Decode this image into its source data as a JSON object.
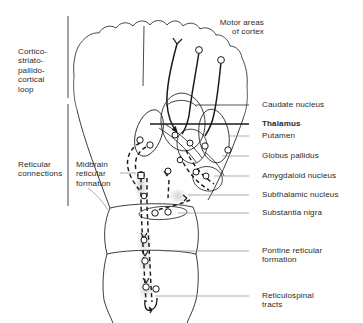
{
  "figure": {
    "title_label": "Motor areas\nof cortex",
    "accent_color": "#1a1a1a",
    "background_color": "#ffffff",
    "shadow_color": "#d9d9d9"
  },
  "group_labels": [
    {
      "id": "cortico-loop",
      "text": "Cortico-\nstriato-\npallido-\ncortical\nloop",
      "x": 18,
      "y": 47
    },
    {
      "id": "reticular-connections",
      "text": "Reticular\nconnections",
      "x": 18,
      "y": 160
    }
  ],
  "inner_labels": [
    {
      "id": "midbrain-reticular-formation",
      "text": "Midbrain\nreticular\nformation",
      "x": 76,
      "y": 160
    }
  ],
  "right_labels": [
    {
      "id": "caudate-nucleus",
      "text": "Caudate nucleus",
      "x": 262,
      "y": 101,
      "leader_y": 105,
      "leader_x1": 249,
      "leader_x2": 196,
      "bold": false
    },
    {
      "id": "thalamus",
      "text": "Thalamus",
      "x": 262,
      "y": 120,
      "leader_y": 124,
      "leader_x1": 249,
      "leader_x2": 150,
      "bold": true
    },
    {
      "id": "putamen",
      "text": "Putamen",
      "x": 262,
      "y": 132,
      "leader_y": 136,
      "leader_x1": 249,
      "leader_x2": 228,
      "bold": false
    },
    {
      "id": "globus-pallidus",
      "text": "Globus pallidus",
      "x": 262,
      "y": 152,
      "leader_y": 156,
      "leader_x1": 249,
      "leader_x2": 222,
      "bold": false
    },
    {
      "id": "amygdaloid-nucleus",
      "text": "Amygdaloid nucleus",
      "x": 262,
      "y": 172,
      "leader_y": 176,
      "leader_x1": 249,
      "leader_x2": 214,
      "bold": false
    },
    {
      "id": "subthalamic-nucleus",
      "text": "Subthalamic nucleus",
      "x": 262,
      "y": 191,
      "leader_y": 195,
      "leader_x1": 249,
      "leader_x2": 188,
      "bold": false
    },
    {
      "id": "substantia-nigra",
      "text": "Substantia nigra",
      "x": 262,
      "y": 209,
      "leader_y": 213,
      "leader_x1": 249,
      "leader_x2": 178,
      "bold": false
    },
    {
      "id": "pontine-reticular-formation",
      "text": "Pontine reticular\nformation",
      "x": 262,
      "y": 247,
      "leader_y": 251,
      "leader_x1": 249,
      "leader_x2": 163,
      "bold": false
    },
    {
      "id": "reticulospinal-tracts",
      "text": "Reticulospinal\ntracts",
      "x": 262,
      "y": 292,
      "leader_y": 296,
      "leader_x1": 249,
      "leader_x2": 155,
      "bold": false
    }
  ],
  "bracket": {
    "x": 68,
    "segments": [
      {
        "id": "bracket-upper",
        "y1": 16,
        "y2": 98
      },
      {
        "id": "bracket-lower",
        "y1": 104,
        "y2": 206
      }
    ]
  },
  "anatomy": {
    "cortex": "scalloped cerebral cortex dome with midline fissure",
    "nuclei": [
      "caudate nucleus",
      "thalamus",
      "putamen",
      "globus pallidus",
      "amygdaloid nucleus",
      "subthalamic nucleus",
      "substantia nigra"
    ],
    "brainstem": [
      "midbrain",
      "pons",
      "medulla"
    ],
    "tracts": [
      "corticostriatal",
      "pallidothalamic",
      "thalamocortical",
      "reticulospinal"
    ]
  }
}
